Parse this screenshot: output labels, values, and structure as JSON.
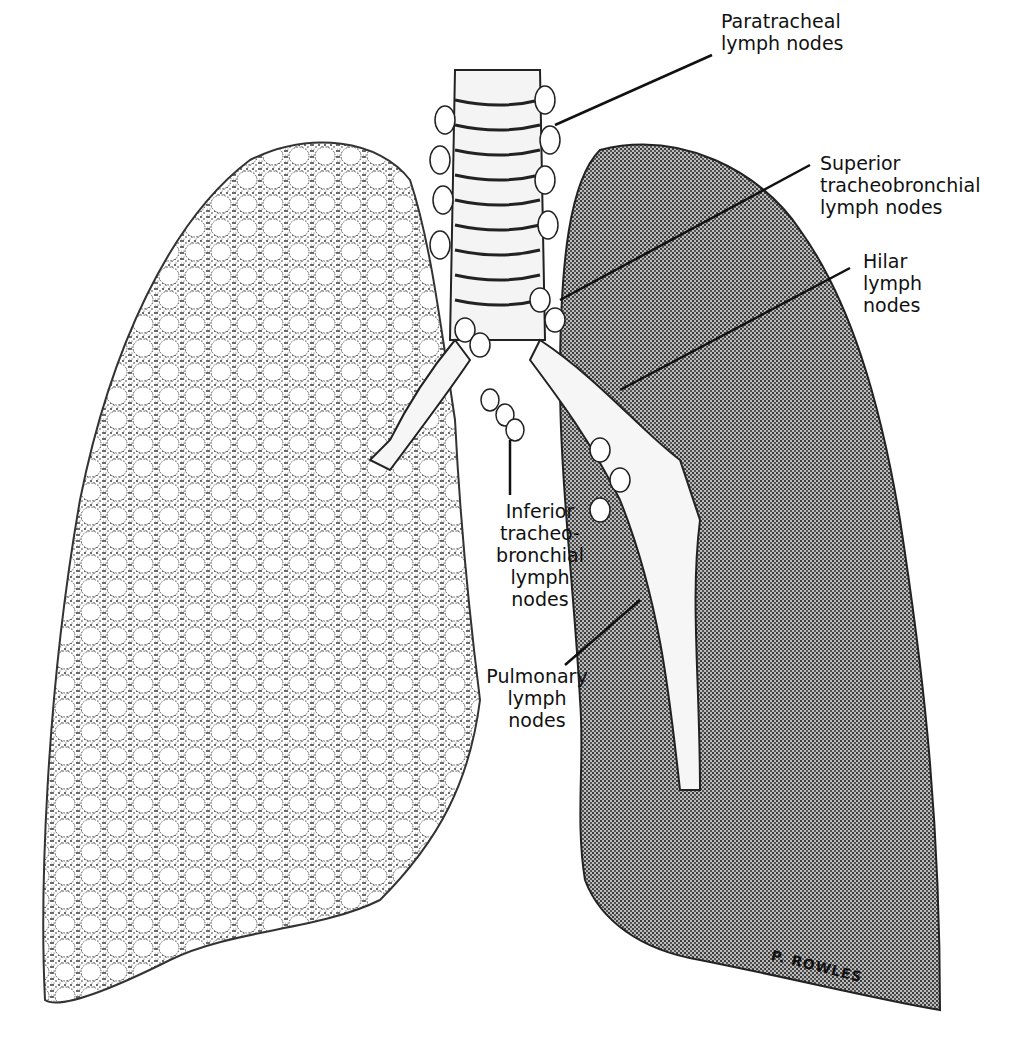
{
  "figure": {
    "labels": [
      {
        "id": "paratracheal",
        "lines": [
          "Paratracheal",
          "lymph nodes"
        ]
      },
      {
        "id": "superior",
        "lines": [
          "Superior",
          "tracheobronchial",
          "lymph nodes"
        ]
      },
      {
        "id": "hilar",
        "lines": [
          "Hilar",
          "lymph",
          "nodes"
        ]
      },
      {
        "id": "inferior",
        "lines": [
          "Inferior",
          "tracheo-",
          "bronchial",
          "lymph",
          "nodes"
        ]
      },
      {
        "id": "pulmonary",
        "lines": [
          "Pulmonary",
          "lymph",
          "nodes"
        ]
      }
    ],
    "signature": "P. ROWLES"
  }
}
